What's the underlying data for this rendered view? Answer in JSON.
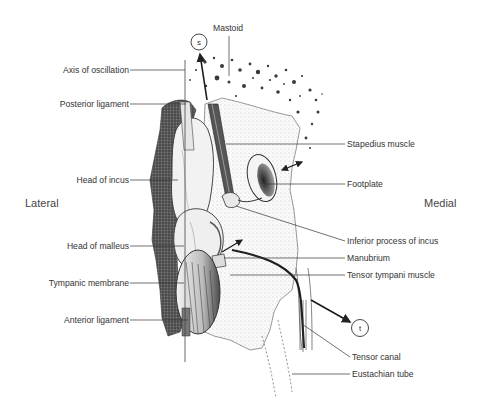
{
  "figure": {
    "type": "anatomical illustration",
    "orientation": {
      "left": "Lateral",
      "right": "Medial"
    },
    "circle_markers": {
      "s": "s",
      "t": "t"
    },
    "labels_left": [
      {
        "text": "Axis of oscillation"
      },
      {
        "text": "Posterior ligament"
      },
      {
        "text": "Head of incus"
      },
      {
        "text": "Head of malleus"
      },
      {
        "text": "Tympanic membrane"
      },
      {
        "text": "Anterior ligament"
      }
    ],
    "labels_top": [
      {
        "text": "Mastoid"
      }
    ],
    "labels_right": [
      {
        "text": "Stapedius muscle"
      },
      {
        "text": "Footplate"
      },
      {
        "text": "Inferior process of incus"
      },
      {
        "text": "Manubrium"
      },
      {
        "text": "Tensor tympani muscle"
      },
      {
        "text": "Tensor canal"
      },
      {
        "text": "Eustachian tube"
      }
    ],
    "colors": {
      "ink": "#2b2b2b",
      "text": "#333333",
      "background": "#ffffff"
    }
  }
}
